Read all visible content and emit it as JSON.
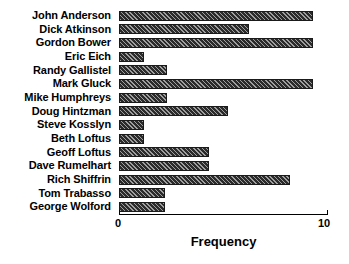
{
  "chart_data": {
    "type": "bar",
    "orientation": "horizontal",
    "title": "",
    "xlabel": "Frequency",
    "ylabel": "",
    "xlim": [
      0,
      10
    ],
    "xticks": [
      0,
      10
    ],
    "xtick_labels": [
      "0",
      "10"
    ],
    "grid": false,
    "legend": null,
    "categories": [
      "John Anderson",
      "Dick Atkinson",
      "Gordon Bower",
      "Eric Eich",
      "Randy Gallistel",
      "Mark Gluck",
      "Mike Humphreys",
      "Doug Hintzman",
      "Steve Kosslyn",
      "Beth Loftus",
      "Geoff Loftus",
      "Dave Rumelhart",
      "Rich Shiffrin",
      "Tom Trabasso",
      "George Wolford"
    ],
    "values": [
      9.3,
      6.2,
      9.3,
      1.2,
      2.3,
      9.3,
      2.3,
      5.2,
      1.2,
      1.2,
      4.3,
      4.3,
      8.2,
      2.2,
      2.2
    ],
    "bar_fill_color": "#2b2b2b",
    "bar_hatch": "diagonal",
    "axis_color": "#000000",
    "background_color": "#ffffff"
  }
}
